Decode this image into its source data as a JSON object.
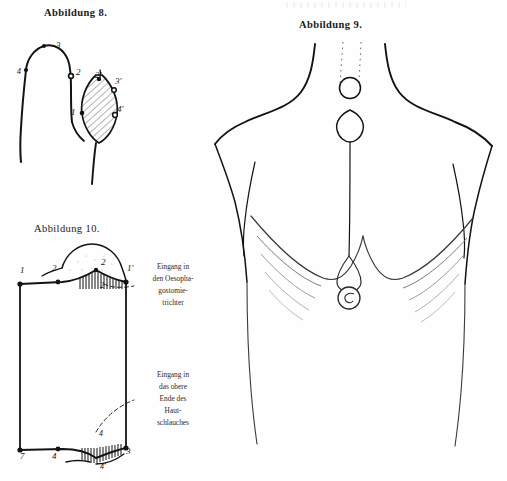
{
  "page": {
    "background_color": "#fefefe",
    "ink_color": "#131313",
    "plate_description": "Three hand-drawn surgical illustrations on a printed book page"
  },
  "figures": [
    {
      "id": "abbildung-8",
      "caption": "Abbildung 8.",
      "description": "Sagittal sketch of neck and chest wall showing skin tube and hatched oesophagostomy funnel",
      "labels": [
        {
          "text": "4",
          "x": 17,
          "y": 68
        },
        {
          "text": "3",
          "x": 56,
          "y": 41
        },
        {
          "text": "2",
          "x": 76,
          "y": 68
        },
        {
          "text": "2'",
          "x": 95,
          "y": 71
        },
        {
          "text": "3'",
          "x": 115,
          "y": 77
        },
        {
          "text": "1",
          "x": 71,
          "y": 108
        },
        {
          "text": "4'",
          "x": 117,
          "y": 105
        }
      ]
    },
    {
      "id": "abbildung-9",
      "caption": "Abbildung 9.",
      "description": "Frontal view of the upper torso with neck stoma, skin tube and lower gastric opening",
      "labels": []
    },
    {
      "id": "abbildung-10",
      "caption": "Abbildung 10.",
      "description": "Rectangular schematic of the skin flap with sutured serrated upper and lower margins",
      "labels": [
        {
          "text": "1",
          "x": 20,
          "y": 266
        },
        {
          "text": "2",
          "x": 52,
          "y": 264
        },
        {
          "text": "2",
          "x": 101,
          "y": 258
        },
        {
          "text": "1'",
          "x": 127,
          "y": 264
        },
        {
          "text": "2",
          "x": 100,
          "y": 282
        },
        {
          "text": "7",
          "x": 20,
          "y": 452
        },
        {
          "text": "4",
          "x": 52,
          "y": 452
        },
        {
          "text": "3",
          "x": 126,
          "y": 447
        },
        {
          "text": "4",
          "x": 99,
          "y": 430
        },
        {
          "text": "4'",
          "x": 100,
          "y": 463
        }
      ],
      "annotations": [
        {
          "id": "annot-oeso",
          "text": "Eingang in\nden Oesopha-\ngostomie-\ntrichter"
        },
        {
          "id": "annot-haut",
          "text": "Eingang in\ndas obere\nEnde des\nHaut-\nschlauches"
        }
      ]
    }
  ]
}
